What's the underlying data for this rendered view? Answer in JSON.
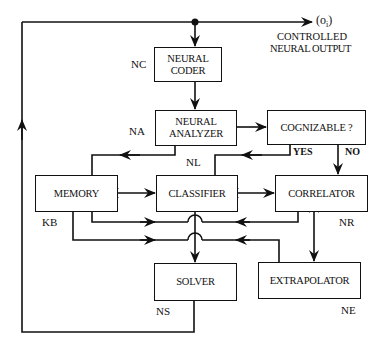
{
  "diagram": {
    "output": {
      "symbol": "(o",
      "subscript": "i",
      "symbol_close": ")",
      "caption_line1": "CONTROLLED",
      "caption_line2": "NEURAL OUTPUT"
    },
    "nodes": {
      "coder": {
        "line1": "NEURAL",
        "line2": "CODER",
        "tag": "NC"
      },
      "analyzer": {
        "line1": "NEURAL",
        "line2": "ANALYZER",
        "tag": "NA"
      },
      "cognizable": {
        "label": "COGNIZABLE ?"
      },
      "memory": {
        "label": "MEMORY",
        "tag": "KB"
      },
      "classifier": {
        "label": "CLASSIFIER",
        "tag": "NL"
      },
      "correlator": {
        "label": "CORRELATOR",
        "tag": "NR"
      },
      "solver": {
        "label": "SOLVER",
        "tag": "NS"
      },
      "extrapolator": {
        "label": "EXTRAPOLATOR",
        "tag": "NE"
      }
    },
    "branches": {
      "yes": "YES",
      "no": "NO"
    }
  }
}
